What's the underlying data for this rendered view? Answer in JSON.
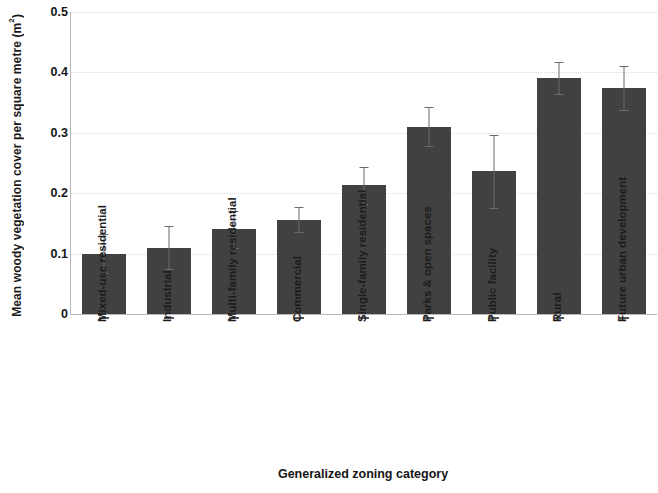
{
  "chart_data": {
    "type": "bar",
    "title": "",
    "xlabel": "Generalized zoning category",
    "ylabel": "Mean woody vegetation cover per square metre (m²)",
    "ylabel_main": "Mean woody vegetation cover per square metre (m",
    "ylabel_sup": "2",
    "ylabel_tail": ")",
    "categories": [
      "Mixed-use residential",
      "Industrial",
      "Multi-family residential",
      "Commercial",
      "Single-family residential",
      "Parks & open spaces",
      "Public facility",
      "Rural",
      "Future urban development"
    ],
    "values": [
      0.1,
      0.11,
      0.14,
      0.156,
      0.213,
      0.31,
      0.236,
      0.391,
      0.374
    ],
    "errors": [
      0.032,
      0.035,
      0.03,
      0.021,
      0.031,
      0.032,
      0.06,
      0.026,
      0.036
    ],
    "ylim": [
      0,
      0.5
    ],
    "ytick_values": [
      0.5,
      0.4,
      0.3,
      0.2,
      0.1,
      0
    ],
    "ytick_labels": [
      "0.5",
      "0.4",
      "0.3",
      "0.2",
      "0.1",
      "0"
    ],
    "grid": "horizontal-dotted",
    "legend": "none",
    "bar_color": "#414141",
    "error_bar_color": "#6b6b6b",
    "gridline_color": "#dcdcdc",
    "axis_color": "#b8b8b8",
    "text_color": "#1a1a1a"
  }
}
